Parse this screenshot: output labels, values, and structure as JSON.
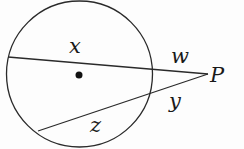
{
  "diagram": {
    "type": "two-secants-from-external-point",
    "colors": {
      "stroke": "#2a2a2a",
      "text": "#1a1a1a",
      "background": "#fdfdfd"
    },
    "circle": {
      "cx": 79.5,
      "cy": 74,
      "r": 73
    },
    "center_dot": {
      "cx": 79,
      "cy": 75,
      "r": 3.5
    },
    "point_P": {
      "x": 208,
      "y": 74,
      "label": "P"
    },
    "secants": [
      {
        "name": "upper-secant",
        "from": [
          8,
          57
        ],
        "to": [
          208,
          74
        ],
        "inner_segment_label": "x",
        "outer_segment_label": "w"
      },
      {
        "name": "lower-secant",
        "from": [
          38,
          131
        ],
        "to": [
          208,
          74
        ],
        "inner_segment_label": "z",
        "outer_segment_label": "y"
      }
    ],
    "labels": {
      "x": {
        "text": "x",
        "x": 69,
        "y": 53
      },
      "w": {
        "text": "w",
        "x": 171,
        "y": 63
      },
      "P": {
        "text": "P",
        "x": 210,
        "y": 82
      },
      "y": {
        "text": "y",
        "x": 169,
        "y": 108
      },
      "z": {
        "text": "z",
        "x": 90,
        "y": 132
      }
    }
  }
}
